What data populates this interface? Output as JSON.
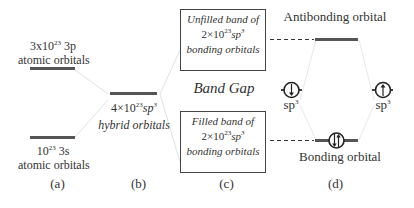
{
  "diagram": {
    "panel_a": {
      "upper_level": {
        "count": "3x10",
        "exp": "23",
        "orbital": " 3p",
        "desc": "atomic orbitals"
      },
      "lower_level": {
        "count": "10",
        "exp": "23",
        "orbital": " 3s",
        "desc": "atomic orbitals"
      },
      "caption": "(a)"
    },
    "panel_b": {
      "level": {
        "count": "4×10",
        "exp": "23",
        "orbital": "sp",
        "orbital_exp": "3",
        "desc": "hybrid orbitals"
      },
      "caption": "(b)"
    },
    "panel_c": {
      "upper_box": {
        "line1": "Unfilled band of",
        "count": "2×10",
        "exp": "23",
        "orbital": "sp",
        "orbital_exp": "3",
        "line3": "bonding orbitals"
      },
      "band_gap": "Band Gap",
      "lower_box": {
        "line1": "Filled band of",
        "count": "2×10",
        "exp": "23",
        "orbital": "sp",
        "orbital_exp": "3",
        "line3": "bonding orbitals"
      },
      "caption": "(c)"
    },
    "panel_d": {
      "antibonding_label": "Antibonding orbital",
      "bonding_label": "Bonding orbital",
      "left_orbital": {
        "label": "sp",
        "exp": "3",
        "spin": "down"
      },
      "right_orbital": {
        "label": "sp",
        "exp": "3",
        "spin": "up"
      },
      "bonding_spin": "paired",
      "caption": "(d)"
    }
  },
  "colors": {
    "level": "#555555",
    "connector": "#e4e4e4",
    "text": "#333333"
  }
}
